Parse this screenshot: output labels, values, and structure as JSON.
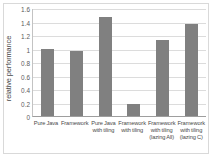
{
  "chart_data": {
    "type": "bar",
    "title": "",
    "xlabel": "",
    "ylabel": "relative performance",
    "ylim": [
      0,
      1.6
    ],
    "ytick_labels": [
      "1.6",
      "1.4",
      "1.2",
      "1",
      "0.8",
      "0.6",
      "0.4",
      "0.2",
      "0"
    ],
    "yticks": [
      1.6,
      1.4,
      1.2,
      1.0,
      0.8,
      0.6,
      0.4,
      0.2,
      0
    ],
    "grid": true,
    "legend": null,
    "bar_color": "#808080",
    "categories": [
      "Pure Java",
      "Framework",
      "Pure Java with tiling",
      "Framework with tiling",
      "Framework with tiling (lazing All)",
      "Framework with tiling (lazing C)"
    ],
    "category_lines": [
      [
        "Pure Java"
      ],
      [
        "Framework"
      ],
      [
        "Pure Java",
        "with tiling"
      ],
      [
        "Framework",
        "with tiling"
      ],
      [
        "Framework",
        "with tiling",
        "(lazing All)"
      ],
      [
        "Framework",
        "with tiling",
        "(lazing C)"
      ]
    ],
    "values": [
      0.99,
      0.96,
      1.46,
      0.18,
      1.12,
      1.36
    ]
  }
}
